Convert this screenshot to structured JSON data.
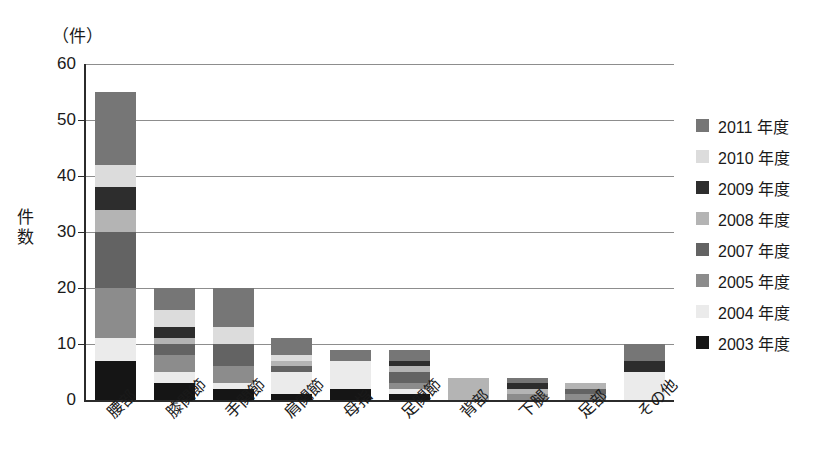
{
  "chart_data": {
    "type": "bar",
    "stacked": true,
    "title": "",
    "unit_label": "（件）",
    "xlabel": "",
    "ylabel": "件数",
    "ylim": [
      0,
      60
    ],
    "yticks": [
      0,
      10,
      20,
      30,
      40,
      50,
      60
    ],
    "grid": true,
    "legend_position": "right",
    "categories": [
      "腰部",
      "膝関節",
      "手関節",
      "肩関節",
      "母指",
      "足関節",
      "背部",
      "下腿",
      "足部",
      "その他"
    ],
    "series": [
      {
        "name": "2003 年度",
        "color": "#151515",
        "values": [
          7,
          3,
          2,
          1,
          2,
          1,
          0,
          0,
          0,
          0
        ]
      },
      {
        "name": "2004 年度",
        "color": "#ebebeb",
        "values": [
          4,
          2,
          1,
          4,
          5,
          1,
          0,
          0,
          0,
          5
        ]
      },
      {
        "name": "2005 年度",
        "color": "#8c8c8c",
        "values": [
          9,
          3,
          3,
          0,
          0,
          1,
          0,
          1,
          1,
          0
        ]
      },
      {
        "name": "2007 年度",
        "color": "#636363",
        "values": [
          10,
          2,
          4,
          1,
          0,
          2,
          0,
          0,
          1,
          0
        ]
      },
      {
        "name": "2008 年度",
        "color": "#b4b4b4",
        "values": [
          4,
          1,
          0,
          1,
          0,
          1,
          4,
          1,
          1,
          0
        ]
      },
      {
        "name": "2009 年度",
        "color": "#2d2d2d",
        "values": [
          4,
          2,
          0,
          0,
          0,
          1,
          0,
          1,
          0,
          2
        ]
      },
      {
        "name": "2010 年度",
        "color": "#dcdcdc",
        "values": [
          4,
          3,
          3,
          1,
          0,
          0,
          0,
          0,
          0,
          0
        ]
      },
      {
        "name": "2011 年度",
        "color": "#767676",
        "values": [
          13,
          4,
          7,
          3,
          2,
          2,
          0,
          1,
          0,
          3
        ]
      }
    ],
    "totals": [
      55,
      20,
      20,
      11,
      9,
      9,
      4,
      4,
      3,
      10
    ]
  },
  "legend": {
    "entries": [
      {
        "label": "2011 年度"
      },
      {
        "label": "2010 年度"
      },
      {
        "label": "2009 年度"
      },
      {
        "label": "2008 年度"
      },
      {
        "label": "2007 年度"
      },
      {
        "label": "2005 年度"
      },
      {
        "label": "2004 年度"
      },
      {
        "label": "2003 年度"
      }
    ]
  }
}
